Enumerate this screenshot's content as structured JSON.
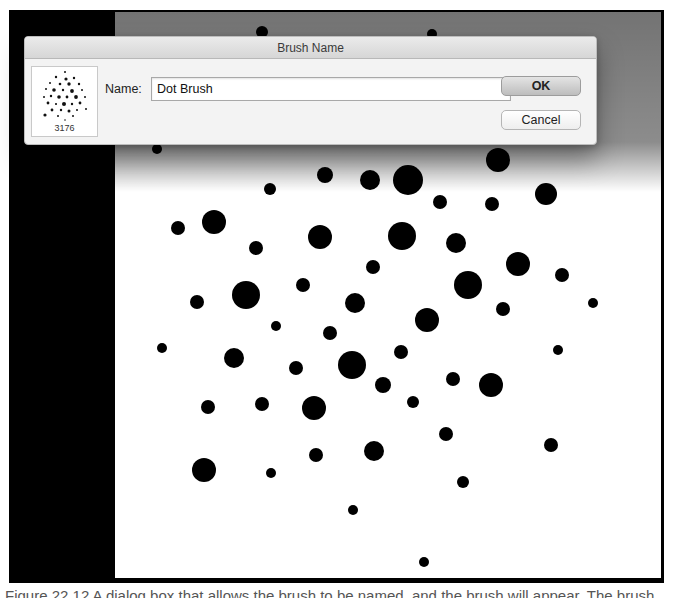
{
  "dialog": {
    "title": "Brush Name",
    "name_label": "Name:",
    "name_value": "Dot Brush",
    "ok_label": "OK",
    "cancel_label": "Cancel",
    "thumbnail_count": "3176"
  },
  "caption": "Figure 22.12  A dialog box that allows the brush to be named, and the brush will appear. The brush",
  "colors": {
    "frame": "#000000",
    "canvas": "#ffffff",
    "dialog_bg": "#f3f3f3"
  },
  "dots": [
    [
      262,
      32,
      6
    ],
    [
      432,
      34,
      5
    ],
    [
      157,
      149,
      5
    ],
    [
      270,
      189,
      6
    ],
    [
      325,
      175,
      8
    ],
    [
      370,
      180,
      10
    ],
    [
      408,
      180,
      15
    ],
    [
      440,
      202,
      7
    ],
    [
      492,
      204,
      7
    ],
    [
      498,
      160,
      12
    ],
    [
      546,
      194,
      11
    ],
    [
      178,
      228,
      7
    ],
    [
      214,
      222,
      12
    ],
    [
      256,
      248,
      7
    ],
    [
      320,
      237,
      12
    ],
    [
      402,
      236,
      14
    ],
    [
      456,
      243,
      10
    ],
    [
      518,
      264,
      12
    ],
    [
      562,
      275,
      7
    ],
    [
      373,
      267,
      7
    ],
    [
      197,
      302,
      7
    ],
    [
      246,
      295,
      14
    ],
    [
      303,
      285,
      7
    ],
    [
      355,
      303,
      10
    ],
    [
      468,
      285,
      14
    ],
    [
      503,
      309,
      7
    ],
    [
      593,
      303,
      5
    ],
    [
      162,
      348,
      5
    ],
    [
      234,
      358,
      10
    ],
    [
      276,
      326,
      5
    ],
    [
      330,
      333,
      7
    ],
    [
      352,
      365,
      14
    ],
    [
      401,
      352,
      7
    ],
    [
      427,
      320,
      12
    ],
    [
      558,
      350,
      5
    ],
    [
      208,
      407,
      7
    ],
    [
      262,
      404,
      7
    ],
    [
      296,
      368,
      7
    ],
    [
      314,
      408,
      12
    ],
    [
      383,
      385,
      8
    ],
    [
      413,
      402,
      6
    ],
    [
      453,
      379,
      7
    ],
    [
      491,
      385,
      12
    ],
    [
      204,
      470,
      12
    ],
    [
      271,
      473,
      5
    ],
    [
      316,
      455,
      7
    ],
    [
      374,
      451,
      10
    ],
    [
      446,
      434,
      7
    ],
    [
      551,
      445,
      7
    ],
    [
      463,
      482,
      6
    ],
    [
      353,
      510,
      5
    ],
    [
      424,
      562,
      5
    ]
  ]
}
